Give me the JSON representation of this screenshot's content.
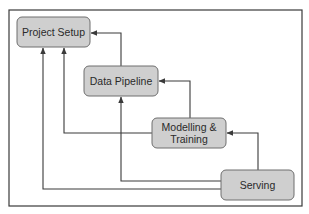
{
  "diagram": {
    "type": "flow",
    "nodes": [
      {
        "id": "project_setup",
        "label_lines": [
          "Project Setup"
        ]
      },
      {
        "id": "data_pipeline",
        "label_lines": [
          "Data Pipeline"
        ]
      },
      {
        "id": "modelling_training",
        "label_lines": [
          "Modelling &",
          "Training"
        ]
      },
      {
        "id": "serving",
        "label_lines": [
          "Serving"
        ]
      }
    ],
    "edges": [
      {
        "from": "data_pipeline",
        "to": "project_setup"
      },
      {
        "from": "modelling_training",
        "to": "data_pipeline"
      },
      {
        "from": "serving",
        "to": "modelling_training"
      },
      {
        "from": "modelling_training",
        "to": "project_setup"
      },
      {
        "from": "serving",
        "to": "data_pipeline"
      },
      {
        "from": "serving",
        "to": "project_setup"
      }
    ],
    "colors": {
      "node_fill": "#cfcfcf",
      "node_border": "#6e6e6e",
      "edge": "#3a3a3a",
      "text": "#2a2a2a"
    }
  }
}
